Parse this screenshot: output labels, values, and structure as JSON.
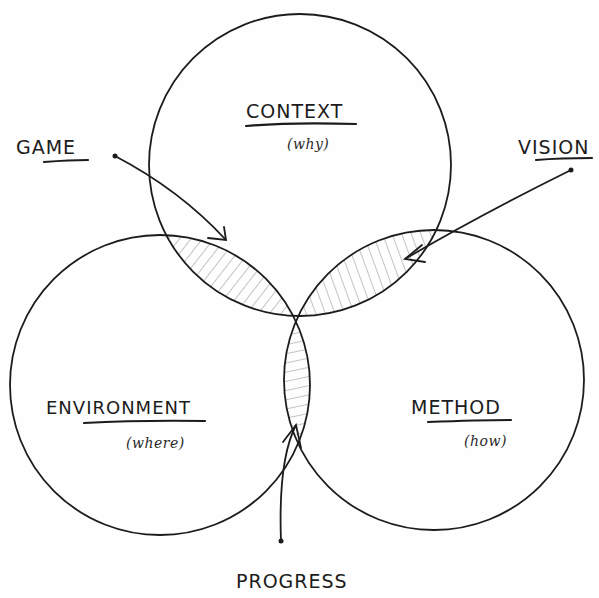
{
  "diagram": {
    "type": "venn",
    "sets": [
      {
        "id": "context",
        "label": "CONTEXT",
        "sublabel": "(why)"
      },
      {
        "id": "environment",
        "label": "ENVIRONMENT",
        "sublabel": "(where)"
      },
      {
        "id": "method",
        "label": "METHOD",
        "sublabel": "(how)"
      }
    ],
    "intersections": [
      {
        "label": "GAME",
        "sets": [
          "context",
          "environment"
        ]
      },
      {
        "label": "VISION",
        "sets": [
          "context",
          "method"
        ]
      },
      {
        "label": "PROGRESS",
        "sets": [
          "environment",
          "method"
        ]
      }
    ],
    "colors": {
      "ink": "#1c1c1c",
      "hatch": "#8a8a8a",
      "background": "#fefefe"
    }
  },
  "labels": {
    "context": "CONTEXT",
    "context_sub": "(why)",
    "environment": "ENVIRONMENT",
    "environment_sub": "(where)",
    "method": "METHOD",
    "method_sub": "(how)",
    "game": "GAME",
    "vision": "VISION",
    "progress": "PROGRESS"
  }
}
